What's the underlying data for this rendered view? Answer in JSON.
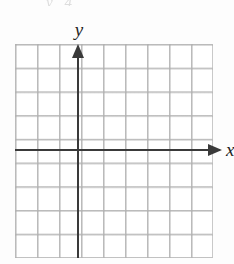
{
  "figure": {
    "width": 234,
    "height": 264,
    "background_color": "#fdfdfd",
    "scan_artifact_text": "y 4"
  },
  "chart_data": {
    "type": "scatter",
    "title": "",
    "subtitle": "",
    "xlabel": "x",
    "ylabel": "y",
    "series": [],
    "x": [],
    "values": [],
    "annotations": [],
    "legend": null,
    "legend_position": "none",
    "grid": true,
    "grid_columns": 9,
    "grid_rows": 9,
    "xlim": [
      -3,
      6
    ],
    "ylim": [
      -5,
      4
    ],
    "xticks": [],
    "yticks": [],
    "tick_labels_visible": false
  },
  "axes": {
    "x": {
      "label": "x",
      "color": "#3a3a3a",
      "arrow_direction": "right",
      "label_clipped": true
    },
    "y": {
      "label": "y",
      "color": "#3a3a3a",
      "arrow_direction": "up",
      "label_clipped": false
    }
  },
  "grid": {
    "line_color": "#c9c9c9",
    "columns": 9,
    "rows": 9,
    "cell_width_px": 22,
    "cell_height_px": 23.72
  }
}
